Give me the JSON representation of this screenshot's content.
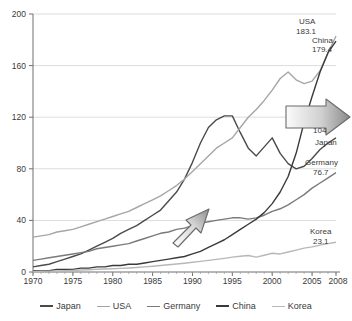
{
  "chart_data": {
    "type": "line",
    "title": "",
    "xlabel": "",
    "ylabel": "",
    "xlim": [
      1970,
      2008
    ],
    "ylim": [
      0,
      200
    ],
    "grid": true,
    "legend_position": "bottom",
    "xticks": [
      "1970",
      "1975",
      "1980",
      "1985",
      "1990",
      "1995",
      "2000",
      "2005",
      "2008"
    ],
    "xtick_values": [
      1970,
      1975,
      1980,
      1985,
      1990,
      1995,
      2000,
      2005,
      2008
    ],
    "yticks": [
      "0",
      "40",
      "80",
      "120",
      "160",
      "200"
    ],
    "ytick_values": [
      0,
      40,
      80,
      120,
      160,
      200
    ],
    "x": [
      1970,
      1971,
      1972,
      1973,
      1974,
      1975,
      1976,
      1977,
      1978,
      1979,
      1980,
      1981,
      1982,
      1983,
      1984,
      1985,
      1986,
      1987,
      1988,
      1989,
      1990,
      1991,
      1992,
      1993,
      1994,
      1995,
      1996,
      1997,
      1998,
      1999,
      2000,
      2001,
      2002,
      2003,
      2004,
      2005,
      2006,
      2007,
      2008
    ],
    "series": [
      {
        "name": "Japan",
        "color": "#4a4a4a",
        "end_value": 104,
        "end_label": "104",
        "values": [
          4,
          5,
          6,
          8,
          10,
          12,
          14,
          17,
          20,
          23,
          26,
          30,
          33,
          36,
          40,
          44,
          48,
          55,
          62,
          72,
          85,
          100,
          112,
          118,
          121,
          121,
          108,
          96,
          90,
          97,
          104,
          92,
          84,
          80,
          82,
          88,
          95,
          100,
          104
        ]
      },
      {
        "name": "USA",
        "color": "#a6a6a6",
        "end_value": 183.1,
        "end_label": "183.1",
        "values": [
          27,
          28,
          29,
          31,
          32,
          33,
          35,
          37,
          39,
          41,
          43,
          45,
          47,
          50,
          53,
          56,
          59,
          63,
          67,
          72,
          78,
          84,
          90,
          96,
          100,
          104,
          112,
          120,
          126,
          133,
          141,
          150,
          155,
          149,
          146,
          148,
          156,
          170,
          183
        ]
      },
      {
        "name": "Germany",
        "color": "#7a7a7a",
        "end_value": 76.7,
        "end_label": "76.7",
        "values": [
          9,
          10,
          11,
          12,
          13,
          14,
          15,
          16,
          18,
          19,
          20,
          21,
          22,
          24,
          26,
          28,
          30,
          31,
          33,
          34,
          36,
          38,
          39,
          40,
          41,
          42,
          42,
          41,
          42,
          44,
          47,
          49,
          52,
          56,
          60,
          65,
          69,
          73,
          77
        ]
      },
      {
        "name": "China",
        "color": "#3a3a3a",
        "end_value": 179.4,
        "end_label": "179.4",
        "values": [
          1,
          1,
          1,
          2,
          2,
          2,
          3,
          3,
          4,
          4,
          5,
          5,
          6,
          6,
          7,
          8,
          9,
          10,
          11,
          12,
          14,
          16,
          19,
          22,
          25,
          29,
          33,
          37,
          41,
          46,
          53,
          62,
          74,
          92,
          116,
          136,
          155,
          170,
          179
        ]
      },
      {
        "name": "Korea",
        "color": "#b8b8b8",
        "end_value": 23.1,
        "end_label": "23.1",
        "values": [
          0.5,
          0.6,
          0.7,
          0.9,
          1.0,
          1.2,
          1.5,
          1.8,
          2.1,
          2.3,
          2.5,
          2.8,
          3.1,
          3.5,
          4.0,
          4.5,
          5.0,
          5.6,
          6.2,
          6.8,
          7.5,
          8.2,
          9.0,
          9.8,
          10.6,
          11.5,
          12.2,
          12.8,
          11.5,
          13.0,
          14.5,
          14.0,
          15.5,
          17.0,
          18.5,
          19.5,
          20.8,
          22.0,
          23.1
        ]
      }
    ],
    "annotations": [
      {
        "name": "arrow-diagonal",
        "kind": "arrow",
        "direction": "up-right"
      },
      {
        "name": "arrow-horizontal",
        "kind": "arrow",
        "direction": "right"
      }
    ]
  },
  "legend": {
    "items": [
      {
        "label": "Japan",
        "color": "#4a4a4a"
      },
      {
        "label": "USA",
        "color": "#a6a6a6"
      },
      {
        "label": "Germany",
        "color": "#7a7a7a"
      },
      {
        "label": "China",
        "color": "#3a3a3a"
      },
      {
        "label": "Korea",
        "color": "#b8b8b8"
      }
    ]
  },
  "series_labels": {
    "usa_name": "USA",
    "usa_value": "183.1",
    "china_name": "China",
    "china_value": "179.4",
    "japan_name": "Japan",
    "japan_value": "104",
    "germany_name": "Germany",
    "germany_value": "76.7",
    "korea_name": "Korea",
    "korea_value": "23.1"
  },
  "axis": {
    "y0": "0",
    "y40": "40",
    "y80": "80",
    "y120": "120",
    "y160": "160",
    "y200": "200",
    "x1970": "1970",
    "x1975": "1975",
    "x1980": "1980",
    "x1985": "1985",
    "x1990": "1990",
    "x1995": "1995",
    "x2000": "2000",
    "x2005": "2005",
    "x2008": "2008"
  }
}
